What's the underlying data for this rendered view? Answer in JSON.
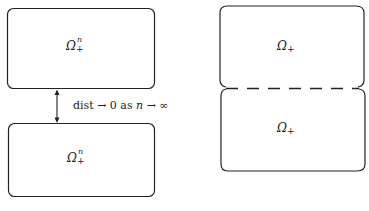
{
  "diagram": {
    "left": {
      "top_region": {
        "symbol": "Ω",
        "superscript": "n",
        "subscript": "+"
      },
      "bottom_region": {
        "symbol": "Ω",
        "superscript": "n",
        "subscript": "+"
      },
      "arrow_label": {
        "word": "dist",
        "arrow1": "→",
        "value": "0",
        "as": "as",
        "var": "n",
        "arrow2": "→",
        "limit": "∞"
      }
    },
    "right": {
      "top_region": {
        "symbol": "Ω",
        "subscript": "+"
      },
      "bottom_region": {
        "symbol": "Ω",
        "subscript": "+"
      },
      "interface": "dashed"
    },
    "colors": {
      "stroke": "#222222",
      "background": "#ffffff"
    }
  }
}
